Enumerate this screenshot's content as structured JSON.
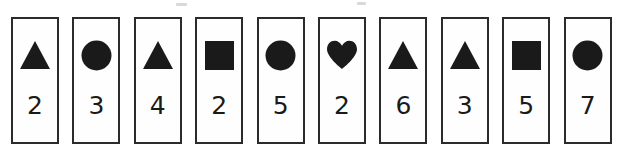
{
  "strip": {
    "title": "Shape and number card strip",
    "card_count": 10,
    "colors": {
      "background": "#ffffff",
      "card_fill": "#fefefe",
      "card_border": "#2b2b2b",
      "shape_fill": "#1a1a1a",
      "number_text": "#1a1a1a"
    },
    "cards": [
      {
        "shape": "triangle-icon",
        "shape_label": "triangle",
        "number": "2"
      },
      {
        "shape": "circle-icon",
        "shape_label": "circle",
        "number": "3"
      },
      {
        "shape": "triangle-icon",
        "shape_label": "triangle",
        "number": "4"
      },
      {
        "shape": "square-icon",
        "shape_label": "square",
        "number": "2"
      },
      {
        "shape": "circle-icon",
        "shape_label": "circle",
        "number": "5"
      },
      {
        "shape": "heart-icon",
        "shape_label": "heart",
        "number": "2"
      },
      {
        "shape": "triangle-icon",
        "shape_label": "triangle",
        "number": "6"
      },
      {
        "shape": "triangle-icon",
        "shape_label": "triangle",
        "number": "3"
      },
      {
        "shape": "square-icon",
        "shape_label": "square",
        "number": "5"
      },
      {
        "shape": "circle-icon",
        "shape_label": "circle",
        "number": "7"
      }
    ]
  }
}
